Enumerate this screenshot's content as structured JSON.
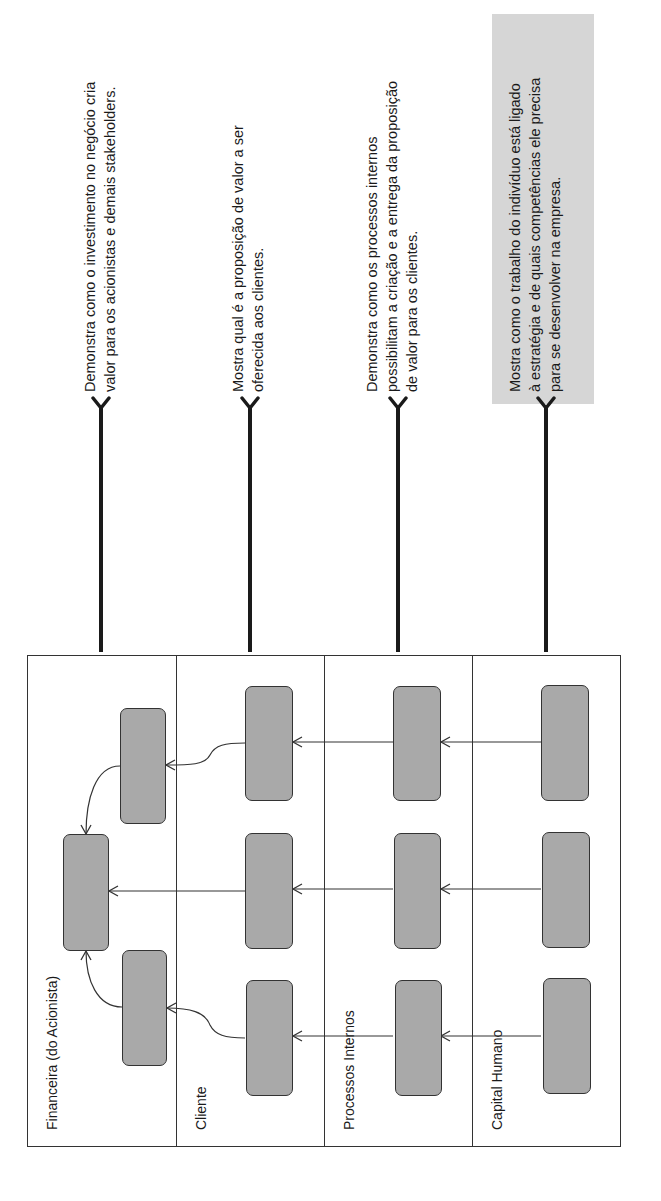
{
  "lanes": [
    {
      "label": "Financeira (do Acionista)",
      "description": [
        "Demonstra como o investimento no negócio cria",
        "valor para os acionistas e demais stakeholders."
      ]
    },
    {
      "label": "Cliente",
      "description": [
        "Mostra qual é a proposição de valor a ser",
        "oferecida aos clientes."
      ]
    },
    {
      "label": "Processos Internos",
      "description": [
        "Demonstra como os processos internos",
        "possibilitam a criação e a entrega da proposição",
        "de valor para os clientes."
      ]
    },
    {
      "label": "Capital Humano",
      "description": [
        "Mostra como o trabalho do indivíduo está ligado",
        "à estratégia e de quais competências ele precisa",
        "para se desenvolver na empresa."
      ],
      "highlighted": true
    }
  ],
  "colors": {
    "node_fill": "#a9a9a9",
    "stroke": "#333333",
    "highlight": "#d6d6d6"
  }
}
